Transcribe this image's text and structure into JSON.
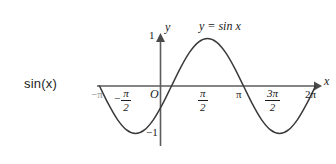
{
  "figure": {
    "side_label": "sin(x)",
    "curve_equation": "y = sin x",
    "axis_x_name": "x",
    "axis_y_name": "y",
    "origin_label": "O",
    "y_tick_top": "1",
    "y_tick_bottom": "−1",
    "neg_sign": "−",
    "x_tick_neg_pi": "−π",
    "x_tick_neg_half_pi_num": "π",
    "x_tick_neg_half_pi_den": "2",
    "x_tick_half_pi_num": "π",
    "x_tick_half_pi_den": "2",
    "x_tick_pi": "π",
    "x_tick_three_half_pi_num": "3π",
    "x_tick_three_half_pi_den": "2",
    "x_tick_two_pi": "2π",
    "stroke_color": "#3a3a3a",
    "axis_color": "#5c5c5c",
    "text_color": "#1a1a1a",
    "background_color": "#ffffff"
  },
  "chart_data": {
    "type": "line",
    "title": "",
    "subtitle": "",
    "xlabel": "x",
    "ylabel": "y",
    "series": [
      {
        "name": "y = sin x",
        "x": [
          -3.14159,
          -2.74889,
          -2.35619,
          -1.9635,
          -1.5708,
          -1.1781,
          -0.7854,
          -0.3927,
          0,
          0.3927,
          0.7854,
          1.1781,
          1.5708,
          1.9635,
          2.35619,
          2.74889,
          3.14159,
          3.53429,
          3.92699,
          4.31969,
          4.71239,
          5.10509,
          5.49779,
          5.89049,
          6.28319
        ],
        "values": [
          0,
          -0.38268,
          -0.70711,
          -0.92388,
          -1,
          -0.92388,
          -0.70711,
          -0.38268,
          0,
          0.38268,
          0.70711,
          0.92388,
          1,
          0.92388,
          0.70711,
          0.38268,
          0,
          -0.38268,
          -0.70711,
          -0.92388,
          -1,
          -0.92388,
          -0.70711,
          -0.38268,
          0
        ]
      }
    ],
    "xlim": [
      -3.14159,
      6.28319
    ],
    "ylim": [
      -1,
      1
    ],
    "xticks": [
      -3.14159,
      -1.5708,
      0,
      1.5708,
      3.14159,
      4.71239,
      6.28319
    ],
    "xticklabels": [
      "−π",
      "−π/2",
      "O",
      "π/2",
      "π",
      "3π/2",
      "2π"
    ],
    "yticks": [
      -1,
      1
    ],
    "yticklabels": [
      "−1",
      "1"
    ],
    "grid": false,
    "legend": false,
    "annotations": [
      "y = sin x"
    ]
  }
}
